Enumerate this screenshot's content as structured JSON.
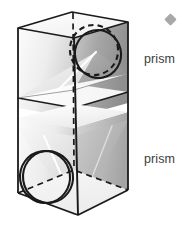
{
  "figure": {
    "labels": {
      "upper": "prism",
      "lower": "prism"
    },
    "marker": {
      "shape": "diamond",
      "color": "#a8a8a8"
    },
    "colors": {
      "outline": "#1a1a1a",
      "hidden_edge": "#1a1a1a",
      "text": "#3c3c3c",
      "shade_light": "#f2f2f2",
      "shade_mid": "#d9d9d9",
      "shade_dark": "#9a9a9a",
      "highlight": "#ffffff",
      "background": "#ffffff"
    },
    "geometry": {
      "box_top_front_left": [
        18,
        28
      ],
      "box_top_apex": [
        72,
        12
      ],
      "box_top_right": [
        128,
        22
      ],
      "box_top_back": [
        74,
        38
      ],
      "box_bottom_front_left": [
        18,
        193
      ],
      "box_bottom_front_center": [
        78,
        215
      ],
      "box_bottom_right": [
        128,
        190
      ],
      "box_bottom_back": [
        74,
        170
      ],
      "mid_upper_y": 98,
      "mid_lower_y": 118,
      "upper_circle_center": [
        96,
        52
      ],
      "upper_circle_rx": 24,
      "upper_circle_ry": 25,
      "lower_circle_center": [
        46,
        178
      ],
      "lower_circle_rx": 25,
      "lower_circle_ry": 26
    },
    "elements": {
      "upper_circle_style": "dashed-and-solid",
      "lower_circle_style": "solid-double",
      "vertical_axis_style": "dashed"
    }
  }
}
